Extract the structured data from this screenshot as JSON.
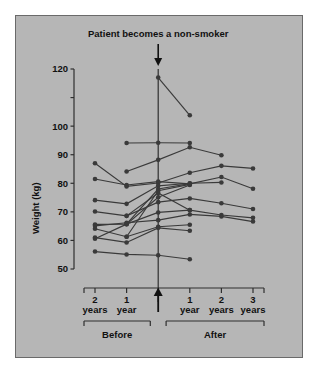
{
  "panel": {
    "background_color": "#b6b6b6",
    "border_color": "#6a6a6a",
    "page_background": "#ffffff"
  },
  "chart_data": {
    "type": "line",
    "title": "Patient becomes a non-smoker",
    "subtitle": "",
    "xlabel": "",
    "ylabel": "Weight (kg)",
    "ylim": [
      50,
      120
    ],
    "grid": false,
    "legend_position": "none",
    "y_ticks": [
      50,
      60,
      70,
      80,
      90,
      100,
      110,
      120
    ],
    "y_tick_labels": [
      "50",
      "60",
      "70",
      "80",
      "90",
      "100",
      "",
      "120"
    ],
    "x": [
      -2,
      -1,
      0,
      1,
      2,
      3
    ],
    "x_tick_labels": [
      "2\nyears",
      "1\nyear",
      "",
      "1\nyear",
      "2\nyears",
      "3\nyears"
    ],
    "x_tick_lines": [
      "2",
      "1",
      "",
      "1",
      "2",
      "3"
    ],
    "x_tick_units": [
      "years",
      "year",
      "",
      "year",
      "years",
      "years"
    ],
    "annotations": [
      {
        "name": "top-arrow",
        "text": "Patient becomes a non-smoker",
        "x": 0,
        "direction": "down"
      },
      {
        "name": "bottom-arrow",
        "text": "",
        "x": 0,
        "direction": "up"
      }
    ],
    "group_brackets": [
      {
        "label": "Before",
        "from": -2,
        "to": -0.25
      },
      {
        "label": "After",
        "from": 0.25,
        "to": 3
      }
    ],
    "marker": "circle",
    "marker_color": "#3a3a3a",
    "line_color": "#3a3a3a",
    "series": [
      {
        "name": "Patient 1",
        "x": [
          0,
          1
        ],
        "values": [
          117.0,
          103.8
        ]
      },
      {
        "name": "Patient 2",
        "x": [
          -1,
          0,
          1
        ],
        "values": [
          94.1,
          94.2,
          94.1
        ]
      },
      {
        "name": "Patient 3",
        "x": [
          -1,
          0,
          1,
          2
        ],
        "values": [
          84.1,
          88.2,
          92.6,
          89.8
        ]
      },
      {
        "name": "Patient 4",
        "x": [
          -2,
          -1,
          0,
          1,
          2,
          3
        ],
        "values": [
          87.0,
          78.9,
          80.1,
          83.7,
          86.1,
          85.2
        ]
      },
      {
        "name": "Patient 5",
        "x": [
          -2,
          -1,
          0,
          1,
          2,
          3
        ],
        "values": [
          81.5,
          79.4,
          80.6,
          79.8,
          82.2,
          78.1
        ]
      },
      {
        "name": "Patient 6",
        "x": [
          -2,
          -1,
          0,
          1,
          2
        ],
        "values": [
          74.1,
          72.8,
          79.1,
          80.0,
          80.3
        ]
      },
      {
        "name": "Patient 7",
        "x": [
          -2,
          -1,
          0,
          1,
          2,
          3
        ],
        "values": [
          70.1,
          68.6,
          73.4,
          74.7,
          73.0,
          71.0
        ]
      },
      {
        "name": "Patient 8",
        "x": [
          -2,
          -1,
          0,
          1,
          2,
          3
        ],
        "values": [
          65.6,
          65.7,
          69.8,
          70.6,
          68.9,
          67.9
        ]
      },
      {
        "name": "Patient 9",
        "x": [
          -2,
          -1,
          0,
          1,
          2,
          3
        ],
        "values": [
          65.1,
          66.2,
          67.1,
          69.1,
          68.4,
          66.6
        ]
      },
      {
        "name": "Patient 10",
        "x": [
          -2,
          -1,
          0,
          1
        ],
        "values": [
          64.1,
          61.3,
          64.8,
          65.5
        ]
      },
      {
        "name": "Patient 11",
        "x": [
          -2,
          -1,
          0,
          1
        ],
        "values": [
          61.0,
          59.3,
          64.4,
          63.4
        ]
      },
      {
        "name": "Patient 12",
        "x": [
          -2,
          -1,
          0,
          1
        ],
        "values": [
          60.6,
          65.7,
          75.1,
          79.4
        ]
      },
      {
        "name": "Patient 13",
        "x": [
          -2,
          -1,
          0,
          1
        ],
        "values": [
          56.1,
          55.1,
          54.8,
          53.4
        ]
      },
      {
        "name": "Patient 14",
        "x": [
          -1,
          0,
          1
        ],
        "values": [
          61.3,
          77.4,
          79.6
        ]
      },
      {
        "name": "Patient 15",
        "x": [
          -1,
          0,
          1
        ],
        "values": [
          65.8,
          78.0,
          79.9
        ]
      },
      {
        "name": "Patient 16",
        "x": [
          -1,
          0,
          1
        ],
        "values": [
          68.6,
          76.6,
          70.6
        ]
      }
    ]
  }
}
